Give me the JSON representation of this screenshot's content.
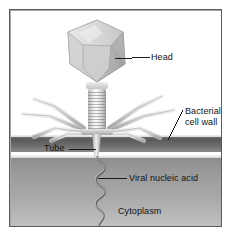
{
  "figure": {
    "type": "diagram",
    "frame_border_color": "#5b5b5b",
    "background_color": "#ffffff"
  },
  "labels": {
    "head": "Head",
    "bacterial_line1": "Bacterial",
    "bacterial_line2": "cell wall",
    "tube": "Tube",
    "viral_nucleic_acid": "Viral nucleic acid",
    "cytoplasm": "Cytoplasm"
  },
  "regions": {
    "cell_wall": {
      "name": "Bacterial cell wall",
      "color": "#5a5a5a"
    },
    "membrane": {
      "name": "plasma membrane",
      "color": "#ffffff"
    },
    "cytoplasm": {
      "name": "Cytoplasm",
      "color": "#9a9a9a"
    }
  },
  "phage_parts": {
    "head": "icosahedral capsid head",
    "collar": "collar",
    "sheath": "contractile tail sheath",
    "baseplate": "baseplate",
    "tube": "tail tube",
    "tail_fibers": "tail fibers",
    "nucleic_acid": "viral nucleic acid"
  },
  "colors": {
    "capsid": "#d0d0d0",
    "capsid_shadow": "#9e9e9e",
    "fiber": "#d9d9d9",
    "leader_line": "#1a1a1a",
    "text": "#111111"
  }
}
